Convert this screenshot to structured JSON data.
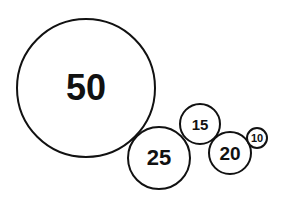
{
  "chart_data": {
    "type": "bubble",
    "title": "",
    "legend": null,
    "grid": false,
    "values": [
      50,
      25,
      15,
      20,
      10
    ],
    "labels": [
      "50",
      "25",
      "15",
      "20",
      "10"
    ],
    "bubbles": [
      {
        "label": "50",
        "value": 50,
        "cx": 86,
        "cy": 88,
        "r": 70,
        "font_size": 36
      },
      {
        "label": "25",
        "value": 25,
        "cx": 159,
        "cy": 158,
        "r": 32,
        "font_size": 22
      },
      {
        "label": "15",
        "value": 15,
        "cx": 200,
        "cy": 124,
        "r": 21,
        "font_size": 15
      },
      {
        "label": "20",
        "value": 20,
        "cx": 230,
        "cy": 153,
        "r": 22,
        "font_size": 19
      },
      {
        "label": "10",
        "value": 10,
        "cx": 257,
        "cy": 138,
        "r": 11,
        "font_size": 11
      }
    ],
    "colors": {
      "stroke": "#111111",
      "fill": "#ffffff",
      "text": "#111111"
    }
  }
}
